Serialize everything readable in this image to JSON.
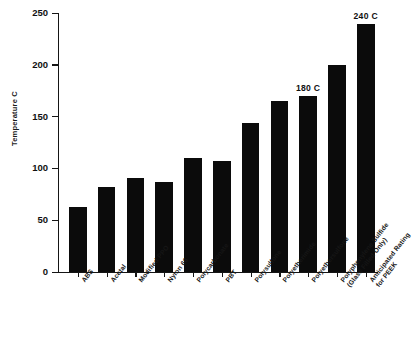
{
  "chart_data": {
    "type": "bar",
    "title": "",
    "xlabel": "",
    "ylabel": "Temperature C",
    "ylim": [
      0,
      250
    ],
    "ytick_labels": [
      "250",
      "200",
      "150",
      "100",
      "50",
      "0"
    ],
    "ytick_values": [
      250,
      200,
      150,
      100,
      50,
      0
    ],
    "grid": false,
    "legend": null,
    "categories": [
      "ABS",
      "Acetal",
      "Modified PPO",
      "Nylon 66",
      "Polycarbonate",
      "PBT",
      "Polysulfone",
      "Polyetherimide",
      "Polyethersulfone",
      "Polyphenylene Sulfide\n(Glass Filled Only)",
      "Anticipated Rating\nfor PEEK"
    ],
    "values": [
      63,
      82,
      91,
      87,
      110,
      107,
      144,
      165,
      170,
      200,
      239
    ],
    "bar_color": "#0b0b0b",
    "annotations": [
      {
        "category": "Polyethersulfone",
        "text": "180 C",
        "value": 170
      },
      {
        "category": "Anticipated Rating for PEEK",
        "text": "240 C",
        "value": 239
      }
    ]
  },
  "axis": {
    "y_title": "Temperature C",
    "ticks": [
      {
        "label": "250",
        "value": 250
      },
      {
        "label": "200",
        "value": 200
      },
      {
        "label": "150",
        "value": 150
      },
      {
        "label": "100",
        "value": 100
      },
      {
        "label": "50",
        "value": 50
      },
      {
        "label": "0",
        "value": 0
      }
    ]
  },
  "bars": [
    {
      "label": "ABS",
      "value": 63,
      "value_label": ""
    },
    {
      "label": "Acetal",
      "value": 82,
      "value_label": ""
    },
    {
      "label": "Modified PPO",
      "value": 91,
      "value_label": ""
    },
    {
      "label": "Nylon 66",
      "value": 87,
      "value_label": ""
    },
    {
      "label": "Polycarbonate",
      "value": 110,
      "value_label": ""
    },
    {
      "label": "PBT",
      "value": 107,
      "value_label": ""
    },
    {
      "label": "Polysulfone",
      "value": 144,
      "value_label": ""
    },
    {
      "label": "Polyetherimide",
      "value": 165,
      "value_label": ""
    },
    {
      "label": "Polyethersulfone",
      "value": 170,
      "value_label": "180 C"
    },
    {
      "label": "Polyphenylene Sulfide\n(Glass Filled Only)",
      "value": 200,
      "value_label": ""
    },
    {
      "label": "Anticipated Rating\nfor PEEK",
      "value": 239,
      "value_label": "240 C"
    }
  ]
}
